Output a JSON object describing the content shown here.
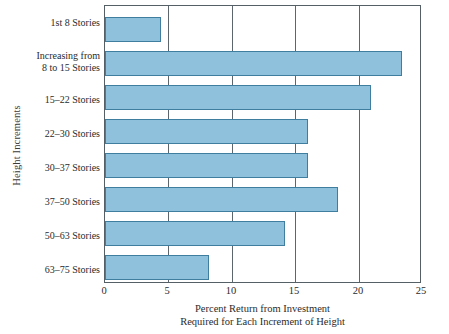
{
  "chart_data": {
    "type": "bar",
    "orientation": "horizontal",
    "title": "",
    "xlabel_line1": "Percent Return from Investment",
    "xlabel_line2": "Required for Each Increment of Height",
    "ylabel": "Height Increments",
    "categories": [
      "1st 8 Stories",
      "Increasing from\n8 to 15 Stories",
      "15–22 Stories",
      "22–30 Stories",
      "30–37 Stories",
      "37–50 Stories",
      "50–63 Stories",
      "63–75 Stories"
    ],
    "values": [
      4.4,
      23.4,
      21.0,
      16.0,
      16.0,
      18.4,
      14.2,
      8.2
    ],
    "xlim": [
      0,
      25
    ],
    "xticks": [
      0,
      5,
      10,
      15,
      20,
      25
    ],
    "xticklabels": [
      "0",
      "5",
      "10",
      "15",
      "20",
      "25"
    ],
    "grid": "vertical",
    "legend": "none",
    "colors": {
      "bar_fill": "#8fc1dc",
      "bar_edge": "#3f7e9e",
      "frame": "#555f66",
      "gridline": "#5d666d",
      "text": "#2b2b2b",
      "background": "#ffffff"
    }
  }
}
